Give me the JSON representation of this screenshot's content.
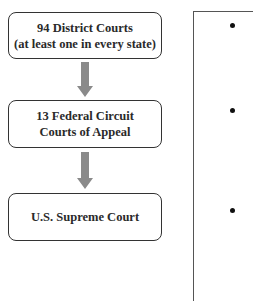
{
  "diagram": {
    "type": "flowchart-vertical",
    "boxes": [
      {
        "line1": "94 District Courts",
        "line2": "(at least one in every state)"
      },
      {
        "line1": "13 Federal Circuit",
        "line2": "Courts of Appeal"
      },
      {
        "line1": "U.S. Supreme Court"
      }
    ],
    "arrows": [
      {
        "from": 0,
        "to": 1,
        "direction": "down"
      },
      {
        "from": 1,
        "to": 2,
        "direction": "down"
      }
    ],
    "colors": {
      "box_border": "#333333",
      "text": "#2a2a2a",
      "arrow_fill": "#8a8a8a",
      "panel_border": "#555555",
      "bullet": "#111111"
    }
  },
  "side_panel": {
    "bullets": [
      "•",
      "•",
      "•"
    ]
  }
}
